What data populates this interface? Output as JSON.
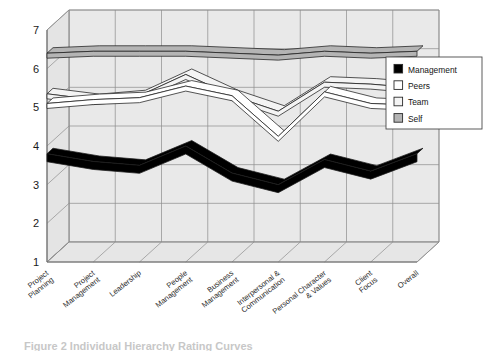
{
  "figure": {
    "caption": "Figure 2  Individual Hierarchy Rating Curves"
  },
  "legend": {
    "position": "upper-right",
    "items": [
      {
        "label": "Management",
        "swatch": "#000000",
        "name": "legend-item-management"
      },
      {
        "label": "Peers",
        "swatch": "#ffffff",
        "name": "legend-item-peers"
      },
      {
        "label": "Team",
        "swatch": "#f4f4f4",
        "name": "legend-item-team"
      },
      {
        "label": "Self",
        "swatch": "#b4b4b4",
        "name": "legend-item-self"
      }
    ]
  },
  "axes": {
    "y_ticks": [
      "7",
      "6",
      "5",
      "4",
      "3",
      "2",
      "1"
    ],
    "ylim": [
      1,
      7
    ]
  },
  "chart_data": {
    "type": "line",
    "title": "",
    "xlabel": "",
    "ylabel": "",
    "ylim": [
      1,
      7
    ],
    "grid": true,
    "legend_position": "upper-right",
    "projection": "3d-ribbon",
    "categories": [
      "Project Planning",
      "Project Management",
      "Leadership",
      "People Management",
      "Business Management",
      "Interpersonal & Communication",
      "Personal Character & Values",
      "Client Focus",
      "Overall"
    ],
    "series": [
      {
        "name": "Management",
        "color": "#000000",
        "values": [
          3.8,
          3.6,
          3.5,
          4.0,
          3.3,
          3.0,
          3.65,
          3.35,
          3.8
        ]
      },
      {
        "name": "Peers",
        "color": "#ffffff",
        "values": [
          5.1,
          5.2,
          5.25,
          5.55,
          5.3,
          4.25,
          5.4,
          5.1,
          5.05
        ]
      },
      {
        "name": "Team",
        "color": "#f4f4f4",
        "values": [
          5.35,
          5.2,
          5.3,
          5.85,
          5.3,
          4.9,
          5.65,
          5.6,
          5.5
        ]
      },
      {
        "name": "Self",
        "color": "#b4b4b4",
        "values": [
          6.4,
          6.45,
          6.45,
          6.45,
          6.4,
          6.35,
          6.45,
          6.4,
          6.45
        ]
      }
    ]
  }
}
